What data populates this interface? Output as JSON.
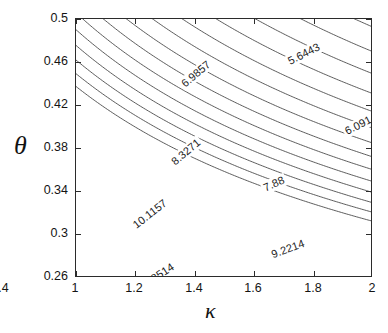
{
  "figure": {
    "background": "#ffffff",
    "axis_color": "#2b2b2b",
    "contour_color": "#4a4a4a"
  },
  "axes": {
    "xlabel": "κ",
    "ylabel": "θ",
    "xticks": [
      "1",
      "1.2",
      "1.4",
      "1.6",
      "1.8",
      "2"
    ],
    "yticks": [
      "0.26",
      "0.3",
      "0.34",
      "0.38",
      "0.42",
      "0.46",
      "0.5"
    ]
  },
  "chart_data": {
    "type": "contour",
    "title": "",
    "xlabel": "κ",
    "ylabel": "θ",
    "xlim": [
      1,
      2
    ],
    "ylim": [
      0.26,
      0.5
    ],
    "xtick_values": [
      1,
      1.2,
      1.4,
      1.6,
      1.8,
      2
    ],
    "ytick_values": [
      0.26,
      0.3,
      0.34,
      0.38,
      0.42,
      0.46,
      0.5
    ],
    "grid": false,
    "legend": "none",
    "colorbar": false,
    "line_color": "#4a4a4a",
    "level_spacing": 0.4471,
    "levels": [
      5.6443,
      6.0914,
      6.5386,
      6.9857,
      7.4329,
      7.88,
      8.3271,
      8.7743,
      9.2214,
      9.6686,
      10.1157,
      10.5629,
      11.01,
      11.4571,
      11.9043,
      12.3514
    ],
    "labeled_levels": [
      {
        "value": 5.6443,
        "label": "5.6443",
        "x_px": 228,
        "y_px": 35,
        "rotation": -27
      },
      {
        "value": 6.0914,
        "label": "6.0914",
        "x_px": 285,
        "y_px": 105,
        "rotation": -27
      },
      {
        "value": 6.9857,
        "label": "6.9857",
        "x_px": 120,
        "y_px": 55,
        "rotation": -40
      },
      {
        "value": 7.88,
        "label": "7.88",
        "x_px": 198,
        "y_px": 165,
        "rotation": -24
      },
      {
        "value": 8.3271,
        "label": "8.3271",
        "x_px": 110,
        "y_px": 133,
        "rotation": -40
      },
      {
        "value": 9.2214,
        "label": "9.2214",
        "x_px": 212,
        "y_px": 230,
        "rotation": -20
      },
      {
        "value": 10.1157,
        "label": "10.1157",
        "x_px": 74,
        "y_px": 195,
        "rotation": -38
      },
      {
        "value": 12.3514,
        "label": "12.3514",
        "x_px": 80,
        "y_px": 258,
        "rotation": -33
      }
    ]
  }
}
